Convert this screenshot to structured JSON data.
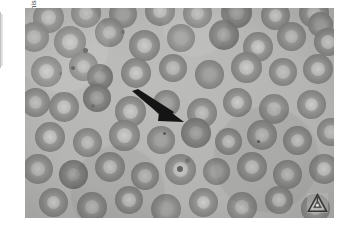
{
  "figure": {
    "kind": "photomicrograph",
    "credit_text": "From The College of American Pathologists, with permission."
  },
  "annotations": {
    "arrow": {
      "name": "pointer-arrow",
      "direction": "down-right",
      "color": "#1a1a1a",
      "x": 130,
      "y": 88,
      "tip_x": 186,
      "tip_y": 122
    }
  },
  "watermark": {
    "label": "CAP",
    "shape": "triangle",
    "color": "#2a2a2a",
    "position": "bottom-right"
  },
  "plate": {
    "x": 25,
    "y": 8,
    "width": 309,
    "height": 210,
    "background_color": "#b4b4b2"
  },
  "colors": {
    "page_background": "#ffffff",
    "field_background": "#b4b4b2",
    "cell_membrane": "#8a8a88",
    "central_pallor": "#c6c6c4",
    "ink": "#1a1a1a",
    "credit_text": "#3a3a3a"
  },
  "cells": [
    {
      "x": 8,
      "y": -6,
      "d": 31,
      "v": "pale"
    },
    {
      "x": 46,
      "y": -10,
      "d": 30,
      "v": "norm"
    },
    {
      "x": 84,
      "y": -8,
      "d": 28,
      "v": "flat"
    },
    {
      "x": 120,
      "y": -12,
      "d": 30,
      "v": "pale"
    },
    {
      "x": 158,
      "y": -9,
      "d": 29,
      "v": "norm"
    },
    {
      "x": 196,
      "y": -11,
      "d": 31,
      "v": "dark"
    },
    {
      "x": 236,
      "y": -7,
      "d": 29,
      "v": "pale"
    },
    {
      "x": 274,
      "y": -10,
      "d": 30,
      "v": "norm"
    },
    {
      "x": 283,
      "y": 4,
      "d": 25,
      "v": "flat"
    },
    {
      "x": -6,
      "y": 14,
      "d": 30,
      "v": "norm"
    },
    {
      "x": 29,
      "y": 18,
      "d": 32,
      "v": "pale"
    },
    {
      "x": 70,
      "y": 10,
      "d": 29,
      "v": "norm"
    },
    {
      "x": 104,
      "y": 22,
      "d": 31,
      "v": "pale"
    },
    {
      "x": 142,
      "y": 16,
      "d": 28,
      "v": "flat"
    },
    {
      "x": 184,
      "y": 12,
      "d": 30,
      "v": "dark"
    },
    {
      "x": 218,
      "y": 24,
      "d": 30,
      "v": "pale"
    },
    {
      "x": 252,
      "y": 14,
      "d": 29,
      "v": "norm"
    },
    {
      "x": 289,
      "y": 20,
      "d": 28,
      "v": "pale"
    },
    {
      "x": 6,
      "y": 48,
      "d": 31,
      "v": "pale"
    },
    {
      "x": 44,
      "y": 44,
      "d": 29,
      "v": "norm"
    },
    {
      "x": 62,
      "y": 56,
      "d": 26,
      "v": "dark"
    },
    {
      "x": 96,
      "y": 50,
      "d": 30,
      "v": "pale"
    },
    {
      "x": 134,
      "y": 46,
      "d": 28,
      "v": "norm"
    },
    {
      "x": 170,
      "y": 52,
      "d": 29,
      "v": "flat"
    },
    {
      "x": 206,
      "y": 44,
      "d": 31,
      "v": "pale"
    },
    {
      "x": 244,
      "y": 50,
      "d": 28,
      "v": "norm"
    },
    {
      "x": 278,
      "y": 46,
      "d": 30,
      "v": "pale"
    },
    {
      "x": -4,
      "y": 80,
      "d": 29,
      "v": "norm"
    },
    {
      "x": 24,
      "y": 84,
      "d": 30,
      "v": "pale"
    },
    {
      "x": 58,
      "y": 76,
      "d": 28,
      "v": "dark"
    },
    {
      "x": 90,
      "y": 88,
      "d": 31,
      "v": "pale"
    },
    {
      "x": 128,
      "y": 82,
      "d": 27,
      "v": "flat"
    },
    {
      "x": 162,
      "y": 90,
      "d": 30,
      "v": "norm"
    },
    {
      "x": 198,
      "y": 80,
      "d": 29,
      "v": "pale"
    },
    {
      "x": 234,
      "y": 86,
      "d": 30,
      "v": "norm"
    },
    {
      "x": 272,
      "y": 82,
      "d": 29,
      "v": "pale"
    },
    {
      "x": 10,
      "y": 114,
      "d": 30,
      "v": "pale"
    },
    {
      "x": 48,
      "y": 120,
      "d": 29,
      "v": "norm"
    },
    {
      "x": 84,
      "y": 112,
      "d": 31,
      "v": "pale"
    },
    {
      "x": 122,
      "y": 118,
      "d": 28,
      "v": "flat"
    },
    {
      "x": 156,
      "y": 110,
      "d": 30,
      "v": "dark"
    },
    {
      "x": 190,
      "y": 120,
      "d": 27,
      "v": "pale"
    },
    {
      "x": 222,
      "y": 112,
      "d": 30,
      "v": "norm"
    },
    {
      "x": 258,
      "y": 118,
      "d": 29,
      "v": "pale"
    },
    {
      "x": 292,
      "y": 110,
      "d": 28,
      "v": "norm"
    },
    {
      "x": -2,
      "y": 146,
      "d": 30,
      "v": "norm"
    },
    {
      "x": 34,
      "y": 152,
      "d": 29,
      "v": "dark"
    },
    {
      "x": 70,
      "y": 144,
      "d": 30,
      "v": "pale"
    },
    {
      "x": 106,
      "y": 154,
      "d": 28,
      "v": "norm"
    },
    {
      "x": 140,
      "y": 146,
      "d": 31,
      "v": "pale"
    },
    {
      "x": 178,
      "y": 150,
      "d": 27,
      "v": "flat"
    },
    {
      "x": 212,
      "y": 144,
      "d": 30,
      "v": "pale"
    },
    {
      "x": 248,
      "y": 152,
      "d": 29,
      "v": "norm"
    },
    {
      "x": 284,
      "y": 146,
      "d": 30,
      "v": "pale"
    },
    {
      "x": 14,
      "y": 180,
      "d": 29,
      "v": "pale"
    },
    {
      "x": 52,
      "y": 184,
      "d": 30,
      "v": "norm"
    },
    {
      "x": 90,
      "y": 178,
      "d": 28,
      "v": "pale"
    },
    {
      "x": 126,
      "y": 186,
      "d": 30,
      "v": "flat"
    },
    {
      "x": 164,
      "y": 180,
      "d": 29,
      "v": "pale"
    },
    {
      "x": 202,
      "y": 184,
      "d": 30,
      "v": "norm"
    },
    {
      "x": 240,
      "y": 178,
      "d": 28,
      "v": "pale"
    },
    {
      "x": 276,
      "y": 186,
      "d": 29,
      "v": "norm"
    }
  ],
  "specks": [
    {
      "x": 58,
      "y": 40,
      "d": 5,
      "soft": false
    },
    {
      "x": 46,
      "y": 58,
      "d": 4,
      "soft": false
    },
    {
      "x": 34,
      "y": 64,
      "d": 3,
      "soft": true
    },
    {
      "x": 96,
      "y": 22,
      "d": 4,
      "soft": true
    },
    {
      "x": 138,
      "y": 124,
      "d": 3,
      "soft": false
    },
    {
      "x": 232,
      "y": 132,
      "d": 3,
      "soft": false
    },
    {
      "x": 152,
      "y": 158,
      "d": 6,
      "soft": false
    },
    {
      "x": 160,
      "y": 150,
      "d": 5,
      "soft": true
    },
    {
      "x": 66,
      "y": 96,
      "d": 4,
      "soft": true
    }
  ]
}
